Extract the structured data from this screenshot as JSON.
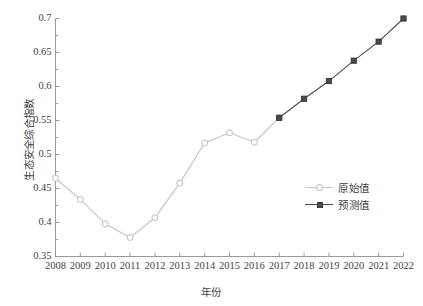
{
  "chart_data": {
    "type": "line",
    "title": "",
    "xlabel": "年份",
    "ylabel": "生态安全综合指数",
    "categories": [
      "2008",
      "2009",
      "2010",
      "2011",
      "2012",
      "2013",
      "2014",
      "2015",
      "2016",
      "2017",
      "2018",
      "2019",
      "2020",
      "2021",
      "2022"
    ],
    "x": [
      2008,
      2009,
      2010,
      2011,
      2012,
      2013,
      2014,
      2015,
      2016,
      2017,
      2018,
      2019,
      2020,
      2021,
      2022
    ],
    "xlim": [
      2008,
      2022
    ],
    "ylim": [
      0.35,
      0.7
    ],
    "yticks": [
      "0.35",
      "0.4",
      "0.45",
      "0.5",
      "0.55",
      "0.6",
      "0.65",
      "0.7"
    ],
    "ytick_values": [
      0.35,
      0.4,
      0.45,
      0.5,
      0.55,
      0.6,
      0.65,
      0.7
    ],
    "xticks": [
      "2008",
      "2009",
      "2010",
      "2011",
      "2012",
      "2013",
      "2014",
      "2015",
      "2016",
      "2017",
      "2018",
      "2019",
      "2020",
      "2021",
      "2022"
    ],
    "grid": false,
    "minor_ticks": true,
    "legend_position": "right-center",
    "series": [
      {
        "name": "原始值",
        "marker": "open-circle",
        "color": "#c9c9c9",
        "x": [
          2008,
          2009,
          2010,
          2011,
          2012,
          2013,
          2014,
          2015,
          2016,
          2017
        ],
        "values": [
          0.465,
          0.434,
          0.398,
          0.378,
          0.407,
          0.458,
          0.517,
          0.532,
          0.518,
          0.554
        ]
      },
      {
        "name": "预测值",
        "marker": "filled-square",
        "color": "#4a4a4a",
        "x": [
          2017,
          2018,
          2019,
          2020,
          2021,
          2022
        ],
        "values": [
          0.554,
          0.582,
          0.608,
          0.638,
          0.666,
          0.7
        ]
      }
    ]
  },
  "axes": {
    "y_title": "生态安全综合指数",
    "x_title": "年份"
  },
  "legend": {
    "items": [
      {
        "label": "原始值",
        "color": "#c9c9c9",
        "marker": "open-circle"
      },
      {
        "label": "预测值",
        "color": "#4a4a4a",
        "marker": "filled-square"
      }
    ]
  },
  "colors": {
    "original_series": "#c9c9c9",
    "predicted_series": "#4a4a4a",
    "axis": "#9a9a9a",
    "text": "#3f3f3f",
    "background": "#ffffff"
  }
}
